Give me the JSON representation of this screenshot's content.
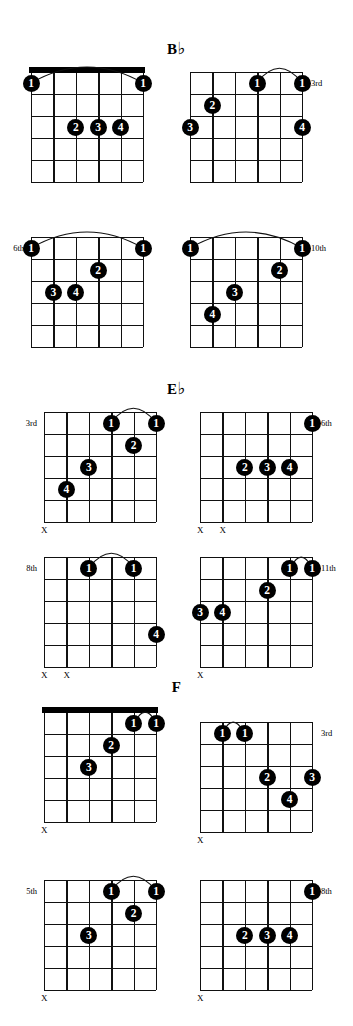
{
  "page": {
    "width": 353,
    "height": 1026,
    "ink_color": "#000000",
    "background": "#ffffff"
  },
  "sections": [
    {
      "name": "B-flat",
      "title_letter": "B",
      "title_accidental": "♭",
      "title_text": "B♭",
      "title_left": 0,
      "title_top": 40,
      "diagrams": [
        {
          "name": "bflat-open-barre",
          "left": 31,
          "top": 72,
          "string_spacing": 22.4,
          "fret_spacing": 22.0,
          "frets": 5,
          "strings": 6,
          "nut": true,
          "position_label": "",
          "position_side": "",
          "barres": [
            {
              "from_string": 1,
              "to_string": 6,
              "fret": 1
            }
          ],
          "dots": [
            {
              "finger": "1",
              "string": 6,
              "fret": 1
            },
            {
              "finger": "1",
              "string": 1,
              "fret": 1
            },
            {
              "finger": "2",
              "string": 4,
              "fret": 3
            },
            {
              "finger": "3",
              "string": 3,
              "fret": 3
            },
            {
              "finger": "4",
              "string": 2,
              "fret": 3
            }
          ],
          "mutes": []
        },
        {
          "name": "bflat-3rd",
          "left": 190,
          "top": 72,
          "string_spacing": 22.4,
          "fret_spacing": 22.0,
          "frets": 5,
          "strings": 6,
          "nut": false,
          "position_label": "3rd",
          "position_side": "right",
          "position_fret": 1,
          "barres": [
            {
              "from_string": 3,
              "to_string": 1,
              "fret": 1
            }
          ],
          "dots": [
            {
              "finger": "1",
              "string": 3,
              "fret": 1
            },
            {
              "finger": "1",
              "string": 1,
              "fret": 1
            },
            {
              "finger": "2",
              "string": 5,
              "fret": 2
            },
            {
              "finger": "3",
              "string": 6,
              "fret": 3
            },
            {
              "finger": "4",
              "string": 1,
              "fret": 3
            }
          ],
          "mutes": []
        },
        {
          "name": "bflat-6th",
          "left": 31,
          "top": 237,
          "string_spacing": 22.4,
          "fret_spacing": 22.0,
          "frets": 5,
          "strings": 6,
          "nut": false,
          "position_label": "6th",
          "position_side": "left",
          "position_fret": 1,
          "barres": [
            {
              "from_string": 6,
              "to_string": 1,
              "fret": 1
            }
          ],
          "dots": [
            {
              "finger": "1",
              "string": 6,
              "fret": 1
            },
            {
              "finger": "1",
              "string": 1,
              "fret": 1
            },
            {
              "finger": "2",
              "string": 3,
              "fret": 2
            },
            {
              "finger": "3",
              "string": 5,
              "fret": 3
            },
            {
              "finger": "4",
              "string": 4,
              "fret": 3
            }
          ],
          "mutes": []
        },
        {
          "name": "bflat-10th",
          "left": 190,
          "top": 237,
          "string_spacing": 22.4,
          "fret_spacing": 22.0,
          "frets": 5,
          "strings": 6,
          "nut": false,
          "position_label": "10th",
          "position_side": "right",
          "position_fret": 1,
          "barres": [
            {
              "from_string": 6,
              "to_string": 1,
              "fret": 1
            }
          ],
          "dots": [
            {
              "finger": "1",
              "string": 6,
              "fret": 1
            },
            {
              "finger": "1",
              "string": 1,
              "fret": 1
            },
            {
              "finger": "2",
              "string": 2,
              "fret": 2
            },
            {
              "finger": "3",
              "string": 4,
              "fret": 3
            },
            {
              "finger": "4",
              "string": 5,
              "fret": 4
            }
          ],
          "mutes": []
        }
      ]
    },
    {
      "name": "E-flat",
      "title_letter": "E",
      "title_accidental": "♭",
      "title_text": "E♭",
      "title_left": 0,
      "title_top": 380,
      "diagrams": [
        {
          "name": "eflat-3rd",
          "left": 44,
          "top": 412,
          "string_spacing": 22.4,
          "fret_spacing": 22.0,
          "frets": 5,
          "strings": 6,
          "nut": false,
          "position_label": "3rd",
          "position_side": "left",
          "position_fret": 1,
          "barres": [
            {
              "from_string": 3,
              "to_string": 1,
              "fret": 1
            }
          ],
          "dots": [
            {
              "finger": "1",
              "string": 3,
              "fret": 1
            },
            {
              "finger": "1",
              "string": 1,
              "fret": 1
            },
            {
              "finger": "2",
              "string": 2,
              "fret": 2
            },
            {
              "finger": "3",
              "string": 4,
              "fret": 3
            },
            {
              "finger": "4",
              "string": 5,
              "fret": 4
            }
          ],
          "mutes": [
            {
              "string": 6
            }
          ]
        },
        {
          "name": "eflat-6th",
          "left": 200,
          "top": 412,
          "string_spacing": 22.4,
          "fret_spacing": 22.0,
          "frets": 5,
          "strings": 6,
          "nut": false,
          "position_label": "6th",
          "position_side": "right",
          "position_fret": 1,
          "barres": [],
          "dots": [
            {
              "finger": "1",
              "string": 1,
              "fret": 1
            },
            {
              "finger": "2",
              "string": 4,
              "fret": 3
            },
            {
              "finger": "3",
              "string": 3,
              "fret": 3
            },
            {
              "finger": "4",
              "string": 2,
              "fret": 3
            }
          ],
          "mutes": [
            {
              "string": 6
            },
            {
              "string": 5
            }
          ]
        },
        {
          "name": "eflat-8th",
          "left": 44,
          "top": 557,
          "string_spacing": 22.4,
          "fret_spacing": 22.0,
          "frets": 5,
          "strings": 6,
          "nut": false,
          "position_label": "8th",
          "position_side": "left",
          "position_fret": 1,
          "barres": [
            {
              "from_string": 4,
              "to_string": 2,
              "fret": 1
            }
          ],
          "dots": [
            {
              "finger": "1",
              "string": 4,
              "fret": 1
            },
            {
              "finger": "1",
              "string": 2,
              "fret": 1
            },
            {
              "finger": "4",
              "string": 1,
              "fret": 4
            }
          ],
          "mutes": [
            {
              "string": 6
            },
            {
              "string": 5
            }
          ]
        },
        {
          "name": "eflat-11th",
          "left": 200,
          "top": 557,
          "string_spacing": 22.4,
          "fret_spacing": 22.0,
          "frets": 5,
          "strings": 6,
          "nut": false,
          "position_label": "11th",
          "position_side": "right",
          "position_fret": 1,
          "barres": [
            {
              "from_string": 2,
              "to_string": 1,
              "fret": 1
            }
          ],
          "dots": [
            {
              "finger": "1",
              "string": 2,
              "fret": 1
            },
            {
              "finger": "1",
              "string": 1,
              "fret": 1
            },
            {
              "finger": "2",
              "string": 3,
              "fret": 2
            },
            {
              "finger": "3",
              "string": 6,
              "fret": 3
            },
            {
              "finger": "4",
              "string": 5,
              "fret": 3
            }
          ],
          "mutes": [
            {
              "string": 6
            }
          ]
        }
      ]
    },
    {
      "name": "F",
      "title_letter": "F",
      "title_accidental": "",
      "title_text": "F",
      "title_left": 0,
      "title_top": 680,
      "diagrams": [
        {
          "name": "f-open-barre",
          "left": 44,
          "top": 712,
          "string_spacing": 22.4,
          "fret_spacing": 22.0,
          "frets": 5,
          "strings": 6,
          "nut": true,
          "position_label": "",
          "position_side": "",
          "barres": [
            {
              "from_string": 2,
              "to_string": 1,
              "fret": 1
            }
          ],
          "dots": [
            {
              "finger": "1",
              "string": 2,
              "fret": 1
            },
            {
              "finger": "1",
              "string": 1,
              "fret": 1
            },
            {
              "finger": "2",
              "string": 3,
              "fret": 2
            },
            {
              "finger": "3",
              "string": 4,
              "fret": 3
            }
          ],
          "mutes": [
            {
              "string": 6
            }
          ]
        },
        {
          "name": "f-3rd",
          "left": 200,
          "top": 722,
          "string_spacing": 22.4,
          "fret_spacing": 22.0,
          "frets": 5,
          "strings": 6,
          "nut": false,
          "position_label": "3rd",
          "position_side": "right",
          "position_fret": 1,
          "barres": [
            {
              "from_string": 5,
              "to_string": 4,
              "fret": 1
            }
          ],
          "dots": [
            {
              "finger": "1",
              "string": 5,
              "fret": 1
            },
            {
              "finger": "1",
              "string": 4,
              "fret": 1
            },
            {
              "finger": "2",
              "string": 3,
              "fret": 3
            },
            {
              "finger": "3",
              "string": 1,
              "fret": 3
            },
            {
              "finger": "4",
              "string": 2,
              "fret": 4
            }
          ],
          "mutes": [
            {
              "string": 6
            }
          ]
        },
        {
          "name": "f-5th",
          "left": 44,
          "top": 880,
          "string_spacing": 22.4,
          "fret_spacing": 22.0,
          "frets": 5,
          "strings": 6,
          "nut": false,
          "position_label": "5th",
          "position_side": "left",
          "position_fret": 1,
          "barres": [
            {
              "from_string": 3,
              "to_string": 1,
              "fret": 1
            }
          ],
          "dots": [
            {
              "finger": "1",
              "string": 3,
              "fret": 1
            },
            {
              "finger": "1",
              "string": 1,
              "fret": 1
            },
            {
              "finger": "2",
              "string": 2,
              "fret": 2
            },
            {
              "finger": "3",
              "string": 4,
              "fret": 3
            }
          ],
          "mutes": [
            {
              "string": 6
            }
          ]
        },
        {
          "name": "f-8th",
          "left": 200,
          "top": 880,
          "string_spacing": 22.4,
          "fret_spacing": 22.0,
          "frets": 5,
          "strings": 6,
          "nut": false,
          "position_label": "8th",
          "position_side": "right",
          "position_fret": 1,
          "barres": [],
          "dots": [
            {
              "finger": "1",
              "string": 1,
              "fret": 1
            },
            {
              "finger": "2",
              "string": 4,
              "fret": 3
            },
            {
              "finger": "3",
              "string": 3,
              "fret": 3
            },
            {
              "finger": "4",
              "string": 2,
              "fret": 3
            }
          ],
          "mutes": [
            {
              "string": 6
            }
          ]
        }
      ]
    }
  ],
  "mute_symbol": "X"
}
